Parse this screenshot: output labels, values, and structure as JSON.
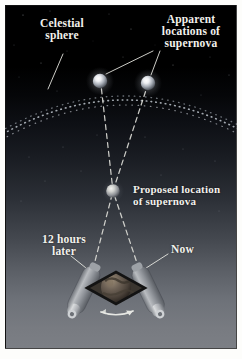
{
  "figure": {
    "domain": "diagram",
    "background": {
      "top_color": "#000000",
      "mid_color": "#2b2f36",
      "bottom_color": "#7c7f85",
      "border_color": "#fdfdfb"
    }
  },
  "labels": {
    "celestial_sphere": "Celestial\nsphere",
    "apparent_locations": "Apparent\nlocations of\nsupernova",
    "proposed_location": "Proposed location\nof supernova",
    "twelve_hours_later": "12 hours\nlater",
    "now": "Now"
  },
  "objects": {
    "apparent_supernova_left": {
      "name": "apparent-supernova-left",
      "cx": 95,
      "cy": 75,
      "r": 7.5,
      "color": "#cfd4dc"
    },
    "apparent_supernova_right": {
      "name": "apparent-supernova-right",
      "cx": 143,
      "cy": 77,
      "r": 7.5,
      "color": "#cfd4dc"
    },
    "proposed_supernova": {
      "name": "proposed-supernova",
      "cx": 108,
      "cy": 186,
      "r": 7.0,
      "color": "#b9bec6"
    },
    "observer_eye": {
      "name": "observer-eye",
      "cx": 111,
      "cy": 283,
      "color": "#1a1a1a"
    },
    "earth_globe": {
      "name": "earth-globe",
      "cx": 111,
      "cy": 282,
      "r": 13,
      "color": "#5a5148"
    },
    "telescope_left": {
      "name": "telescope-12-hours-later",
      "angle_deg": 28
    },
    "telescope_right": {
      "name": "telescope-now",
      "angle_deg": -28
    },
    "rotation_arrow": {
      "name": "earth-rotation-arrow",
      "direction": "right"
    }
  },
  "sightlines": {
    "style": "dashed",
    "color": "#d8d8d2",
    "paths": [
      {
        "name": "sightline-left-telescope-to-right-apparent",
        "from": [
          88,
          266
        ],
        "via": [
          108,
          186
        ],
        "to": [
          143,
          80
        ]
      },
      {
        "name": "sightline-right-telescope-to-left-apparent",
        "from": [
          134,
          266
        ],
        "via": [
          108,
          186
        ],
        "to": [
          95,
          78
        ]
      }
    ]
  },
  "leader_lines": [
    {
      "name": "leader-celestial-sphere",
      "from": [
        57,
        50
      ],
      "to": [
        44,
        84
      ]
    },
    {
      "name": "leader-apparent-left",
      "from": [
        152,
        44
      ],
      "to": [
        100,
        70
      ]
    },
    {
      "name": "leader-apparent-right",
      "from": [
        160,
        44
      ],
      "to": [
        146,
        70
      ]
    },
    {
      "name": "leader-twelve-hours",
      "from": [
        66,
        252
      ],
      "to": [
        86,
        268
      ]
    },
    {
      "name": "leader-now",
      "from": [
        164,
        250
      ],
      "to": [
        139,
        266
      ]
    }
  ],
  "celestial_arc": {
    "name": "celestial-sphere-arc",
    "style": "dotted",
    "color": "#9aa0a8",
    "description": "dotted arc marking the inner edge of the celestial sphere"
  }
}
